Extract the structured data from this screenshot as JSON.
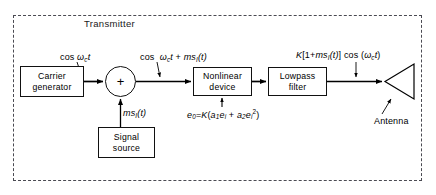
{
  "diagram": {
    "title": "Transmitter",
    "blocks": [
      {
        "id": "carrier-generator",
        "line1": "Carrier",
        "line2": "generator"
      },
      {
        "id": "nonlinear-device",
        "line1": "Nonlinear",
        "line2": "device"
      },
      {
        "id": "lowpass-filter",
        "line1": "Lowpass",
        "line2": "filter"
      },
      {
        "id": "signal-source",
        "line1": "Signal",
        "line2": "source"
      }
    ],
    "adder": {
      "symbol": "+"
    },
    "antenna": {
      "label": "Antenna"
    },
    "signals": {
      "carrier_out": "cos ωc t",
      "sum_out": "cos ωc t + msI(t)",
      "modulating": "msI(t)",
      "nonlinear_eq": "e0 = K(a1ei + a2ei²)",
      "transmitted": "K[1 + msI(t)] cos (ωc t)"
    },
    "colors": {
      "ink": "#000000",
      "frame": "#4a4a52",
      "background": "#ffffff"
    }
  }
}
